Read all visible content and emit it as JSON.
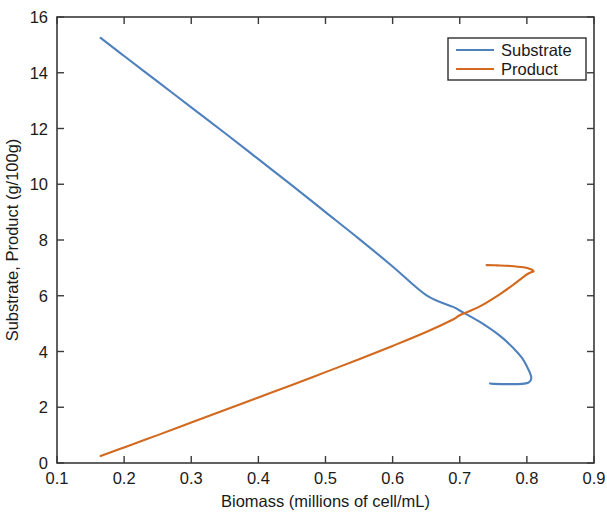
{
  "chart_data": {
    "type": "line",
    "title": "",
    "xlabel": "Biomass (millions of cell/mL)",
    "ylabel": "Substrate, Product (g/100g)",
    "xlim": [
      0.1,
      0.9
    ],
    "ylim": [
      0,
      16
    ],
    "xticks": [
      "0.1",
      "0.2",
      "0.3",
      "0.4",
      "0.5",
      "0.6",
      "0.7",
      "0.8",
      "0.9"
    ],
    "xtick_values": [
      0.1,
      0.2,
      0.3,
      0.4,
      0.5,
      0.6,
      0.7,
      0.8,
      0.9
    ],
    "yticks": [
      "0",
      "2",
      "4",
      "6",
      "8",
      "10",
      "12",
      "14",
      "16"
    ],
    "ytick_values": [
      0,
      2,
      4,
      6,
      8,
      10,
      12,
      14,
      16
    ],
    "grid": false,
    "legend_position": "upper-right",
    "box": true,
    "tick_direction": "in",
    "series": [
      {
        "name": "Substrate",
        "color": "#4f81bd",
        "points": [
          [
            0.165,
            15.25
          ],
          [
            0.2,
            14.6
          ],
          [
            0.25,
            13.68
          ],
          [
            0.3,
            12.76
          ],
          [
            0.35,
            11.84
          ],
          [
            0.4,
            10.9
          ],
          [
            0.45,
            9.96
          ],
          [
            0.5,
            9.0
          ],
          [
            0.55,
            8.04
          ],
          [
            0.6,
            7.05
          ],
          [
            0.65,
            6.02
          ],
          [
            0.69,
            5.6
          ],
          [
            0.7,
            5.47
          ],
          [
            0.73,
            5.06
          ],
          [
            0.76,
            4.56
          ],
          [
            0.78,
            4.12
          ],
          [
            0.793,
            3.76
          ],
          [
            0.801,
            3.42
          ],
          [
            0.806,
            3.14
          ],
          [
            0.806,
            2.98
          ],
          [
            0.802,
            2.88
          ],
          [
            0.793,
            2.84
          ],
          [
            0.775,
            2.83
          ],
          [
            0.75,
            2.84
          ],
          [
            0.745,
            2.85
          ]
        ]
      },
      {
        "name": "Product",
        "color": "#d2691e",
        "points": [
          [
            0.165,
            0.25
          ],
          [
            0.2,
            0.56
          ],
          [
            0.25,
            1.0
          ],
          [
            0.3,
            1.45
          ],
          [
            0.35,
            1.9
          ],
          [
            0.4,
            2.35
          ],
          [
            0.45,
            2.8
          ],
          [
            0.5,
            3.26
          ],
          [
            0.55,
            3.72
          ],
          [
            0.6,
            4.2
          ],
          [
            0.65,
            4.7
          ],
          [
            0.69,
            5.15
          ],
          [
            0.7,
            5.3
          ],
          [
            0.73,
            5.62
          ],
          [
            0.76,
            6.06
          ],
          [
            0.78,
            6.4
          ],
          [
            0.793,
            6.64
          ],
          [
            0.801,
            6.78
          ],
          [
            0.807,
            6.85
          ],
          [
            0.81,
            6.88
          ],
          [
            0.806,
            6.95
          ],
          [
            0.795,
            7.02
          ],
          [
            0.775,
            7.07
          ],
          [
            0.755,
            7.09
          ],
          [
            0.74,
            7.1
          ]
        ]
      }
    ],
    "legend_entries": [
      {
        "label": "Substrate",
        "color": "#4f81bd"
      },
      {
        "label": "Product",
        "color": "#d2691e"
      }
    ]
  }
}
